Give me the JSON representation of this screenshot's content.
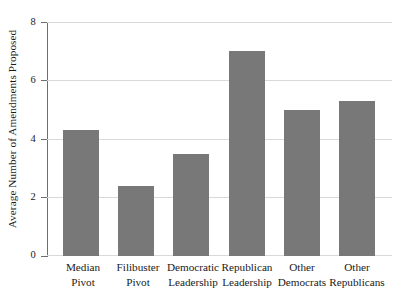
{
  "chart_data": {
    "type": "bar",
    "title": "",
    "subtitle": "",
    "xlabel": "",
    "ylabel": "Average Number of Amendments Proposed",
    "ylim": [
      0,
      8
    ],
    "yticks": [
      0,
      2,
      4,
      6,
      8
    ],
    "ytick_labels": [
      "0",
      "2",
      "4",
      "6",
      "8"
    ],
    "grid": true,
    "grid_axis": "y",
    "legend": null,
    "bar_color": "#787878",
    "grid_color": "#d9d9d9",
    "axis_color": "#6f6f6f",
    "background": "#ffffff",
    "categories": [
      "Median Pivot",
      "Filibuster Pivot",
      "Democratic Leadership",
      "Republican Leadership",
      "Other Democrats",
      "Other Republicans"
    ],
    "category_lines": [
      {
        "line1": "Median",
        "line2": "Pivot"
      },
      {
        "line1": "Filibuster",
        "line2": "Pivot"
      },
      {
        "line1": "Democratic",
        "line2": "Leadership"
      },
      {
        "line1": "Republican",
        "line2": "Leadership"
      },
      {
        "line1": "Other",
        "line2": "Democrats"
      },
      {
        "line1": "Other",
        "line2": "Republicans"
      }
    ],
    "values": [
      4.3,
      2.4,
      3.5,
      7.0,
      5.0,
      5.3
    ]
  }
}
